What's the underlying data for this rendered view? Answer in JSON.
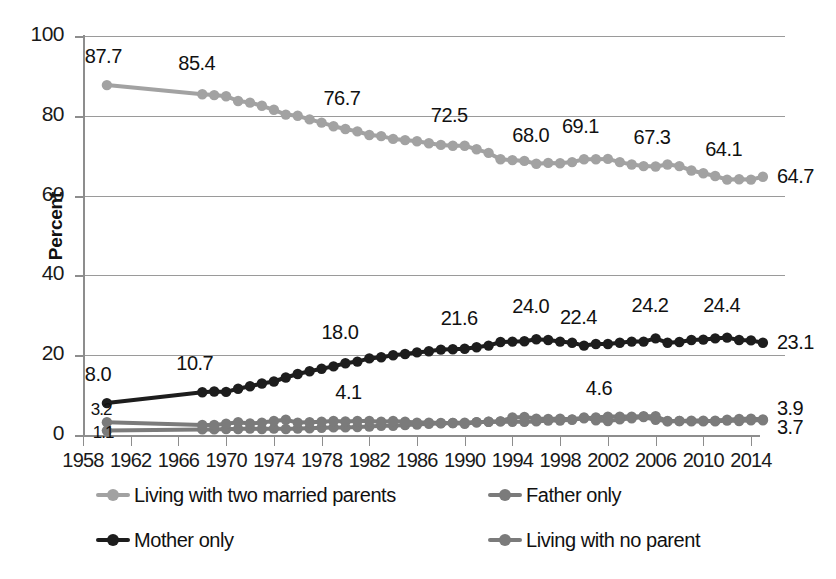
{
  "chart_data": {
    "type": "line",
    "title": "",
    "xlabel": "",
    "ylabel": "Percent",
    "ylim": [
      0,
      100
    ],
    "xlim": [
      1960,
      2015
    ],
    "grid": true,
    "legend_position": "bottom",
    "y_ticks": [
      "0",
      "20",
      "40",
      "60",
      "80",
      "100"
    ],
    "y_tick_values": [
      0,
      20,
      40,
      60,
      80,
      100
    ],
    "x_ticks": [
      "1958",
      "1962",
      "1966",
      "1970",
      "1974",
      "1978",
      "1982",
      "1986",
      "1990",
      "1994",
      "1998",
      "2002",
      "2006",
      "2010",
      "2014"
    ],
    "x_tick_values": [
      1958,
      1962,
      1966,
      1970,
      1974,
      1978,
      1982,
      1986,
      1990,
      1994,
      1998,
      2002,
      2006,
      2010,
      2014
    ],
    "x": [
      1960,
      1968,
      1969,
      1970,
      1971,
      1972,
      1973,
      1974,
      1975,
      1976,
      1977,
      1978,
      1979,
      1980,
      1981,
      1982,
      1983,
      1984,
      1985,
      1986,
      1987,
      1988,
      1989,
      1990,
      1991,
      1992,
      1993,
      1994,
      1995,
      1996,
      1997,
      1998,
      1999,
      2000,
      2001,
      2002,
      2003,
      2004,
      2005,
      2006,
      2007,
      2008,
      2009,
      2010,
      2011,
      2012,
      2013,
      2014,
      2015
    ],
    "series": [
      {
        "name": "Living with two married parents",
        "color": "#a2a2a2",
        "values": [
          87.7,
          85.4,
          85.2,
          84.9,
          83.7,
          83.3,
          82.5,
          81.5,
          80.3,
          80.0,
          79.1,
          78.3,
          77.4,
          76.7,
          76.1,
          75.2,
          74.9,
          74.2,
          73.9,
          73.6,
          73.1,
          72.7,
          72.5,
          72.5,
          71.6,
          70.7,
          69.1,
          68.9,
          68.7,
          68.0,
          68.2,
          68.1,
          68.4,
          69.1,
          69.1,
          69.2,
          68.4,
          67.8,
          67.4,
          67.3,
          67.8,
          67.4,
          66.3,
          65.6,
          64.9,
          64.0,
          64.1,
          64.0,
          64.7
        ],
        "labels": [
          {
            "x": 1960,
            "value": "87.7"
          },
          {
            "x": 1968,
            "value": "85.4"
          },
          {
            "x": 1980,
            "value": "76.7"
          },
          {
            "x": 1989,
            "value": "72.5"
          },
          {
            "x": 1996,
            "value": "68.0"
          },
          {
            "x": 2000,
            "value": "69.1"
          },
          {
            "x": 2006,
            "value": "67.3"
          },
          {
            "x": 2012,
            "value": "64.1"
          },
          {
            "x": 2015,
            "value": "64.7"
          }
        ]
      },
      {
        "name": "Mother only",
        "color": "#1d1d1d",
        "values": [
          8.0,
          10.7,
          10.9,
          10.8,
          11.6,
          12.2,
          12.9,
          13.4,
          14.4,
          15.3,
          16.0,
          16.6,
          17.2,
          18.0,
          18.4,
          19.2,
          19.5,
          20.0,
          20.3,
          20.7,
          21.0,
          21.4,
          21.5,
          21.6,
          22.0,
          22.4,
          23.3,
          23.4,
          23.5,
          24.0,
          23.8,
          23.4,
          23.1,
          22.4,
          22.8,
          22.8,
          23.1,
          23.4,
          23.4,
          24.2,
          23.1,
          23.3,
          23.8,
          23.9,
          24.2,
          24.4,
          23.8,
          23.7,
          23.1
        ],
        "labels": [
          {
            "x": 1960,
            "value": "8.0"
          },
          {
            "x": 1968,
            "value": "10.7"
          },
          {
            "x": 1980,
            "value": "18.0"
          },
          {
            "x": 1990,
            "value": "21.6"
          },
          {
            "x": 1996,
            "value": "24.0"
          },
          {
            "x": 2000,
            "value": "22.4"
          },
          {
            "x": 2006,
            "value": "24.2"
          },
          {
            "x": 2012,
            "value": "24.4"
          },
          {
            "x": 2015,
            "value": "23.1"
          }
        ]
      },
      {
        "name": "Father only",
        "color": "#7b7b7b",
        "values": [
          1.1,
          1.4,
          1.4,
          1.5,
          1.5,
          1.6,
          1.5,
          1.6,
          1.5,
          1.6,
          1.7,
          1.8,
          1.9,
          1.9,
          2.0,
          2.1,
          2.3,
          2.3,
          2.5,
          2.6,
          2.8,
          2.9,
          3.0,
          3.1,
          3.2,
          3.3,
          3.4,
          3.3,
          3.3,
          3.4,
          3.6,
          3.6,
          3.8,
          4.2,
          4.4,
          4.6,
          4.6,
          4.6,
          4.7,
          4.7,
          3.4,
          3.5,
          3.4,
          3.4,
          3.6,
          3.8,
          4.0,
          4.1,
          3.9
        ],
        "labels": [
          {
            "x": 1960,
            "value": "1.1"
          },
          {
            "x": 2002,
            "value": "4.6"
          },
          {
            "x": 2015,
            "value": "3.9"
          }
        ]
      },
      {
        "name": "Living with no parent",
        "color": "#7b7b7b",
        "values": [
          3.2,
          2.5,
          2.5,
          2.8,
          3.2,
          2.9,
          3.1,
          3.5,
          3.8,
          3.1,
          3.2,
          3.3,
          3.5,
          3.4,
          3.5,
          3.5,
          3.3,
          3.5,
          3.3,
          3.1,
          3.1,
          3.0,
          3.0,
          2.8,
          3.2,
          3.3,
          3.4,
          4.4,
          4.5,
          4.1,
          4.0,
          4.1,
          3.9,
          4.4,
          3.7,
          3.5,
          3.9,
          4.2,
          4.5,
          3.8,
          3.5,
          3.5,
          3.6,
          3.6,
          3.4,
          3.6,
          3.5,
          3.7,
          3.7
        ],
        "labels": [
          {
            "x": 1960,
            "value": "3.2"
          },
          {
            "x": 1981,
            "value": "4.1"
          },
          {
            "x": 2015,
            "value": "3.7"
          }
        ]
      }
    ]
  },
  "axis": {
    "y_title": "Percent"
  },
  "legend": {
    "items": [
      {
        "label": "Living with two married parents",
        "color": "#a2a2a2"
      },
      {
        "label": "Father only",
        "color": "#7b7b7b"
      },
      {
        "label": "Mother only",
        "color": "#1d1d1d"
      },
      {
        "label": "Living with no parent",
        "color": "#7b7b7b"
      }
    ]
  }
}
